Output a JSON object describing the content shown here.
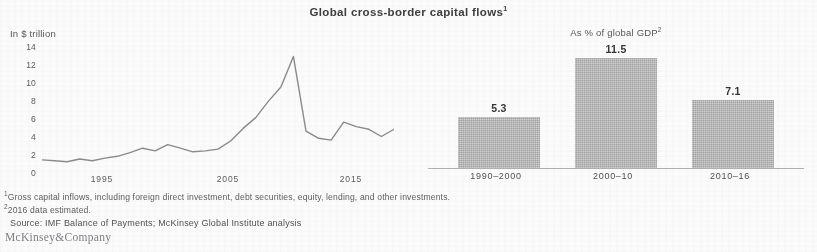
{
  "exhibit": {
    "title": "Global cross-border capital flows",
    "title_footnote_marker": "1",
    "brand": "McKinsey&Company"
  },
  "footnotes": {
    "note1_marker": "1",
    "note1": "Gross capital inflows, including foreign direct investment, debt securities, equity, lending, and other investments.",
    "note2_marker": "2",
    "note2": "2016 data estimated.",
    "source": "Source: IMF Balance of Payments; McKinsey Global Institute analysis"
  },
  "chart_data": [
    {
      "type": "line",
      "title": "Global cross-border capital flows",
      "ylabel": "In $ trillion",
      "xlabel": "",
      "ylim": [
        0,
        14
      ],
      "yticks": [
        14,
        12,
        10,
        8,
        6,
        4,
        2,
        0
      ],
      "xticks": [
        "1995",
        "2005",
        "2015"
      ],
      "grid": false,
      "x": [
        1990,
        1991,
        1992,
        1993,
        1994,
        1995,
        1996,
        1997,
        1998,
        1999,
        2000,
        2001,
        2002,
        2003,
        2004,
        2005,
        2006,
        2007,
        2008,
        2009,
        2010,
        2011,
        2012,
        2013,
        2014,
        2015,
        2016
      ],
      "values": [
        0.9,
        0.8,
        0.7,
        1.0,
        0.8,
        1.1,
        1.3,
        1.7,
        2.2,
        1.9,
        2.6,
        2.2,
        1.8,
        1.9,
        2.1,
        3.0,
        4.4,
        5.6,
        7.4,
        9.0,
        12.4,
        4.1,
        3.3,
        3.1,
        5.1,
        4.6,
        4.3,
        3.5,
        4.3
      ]
    },
    {
      "type": "bar",
      "title": "As % of global GDP",
      "title_footnote_marker": "2",
      "ylabel": "",
      "xlabel": "",
      "ylim": [
        0,
        13
      ],
      "grid": false,
      "categories": [
        "1990–2000",
        "2000–10",
        "2010–16"
      ],
      "values": [
        5.3,
        11.5,
        7.1
      ],
      "value_labels": [
        "5.3",
        "11.5",
        "7.1"
      ],
      "bar_color": "#b4b4b4"
    }
  ],
  "line_chart": {
    "unit_label": "In $ trillion",
    "y_ticks": [
      "14",
      "12",
      "10",
      "8",
      "6",
      "4",
      "2",
      "0"
    ],
    "x_ticks": [
      "1995",
      "2005",
      "2015"
    ]
  },
  "bar_chart": {
    "unit_label": "As % of global GDP",
    "bars": [
      {
        "category": "1990–2000",
        "label": "5.3"
      },
      {
        "category": "2000–10",
        "label": "11.5"
      },
      {
        "category": "2010–16",
        "label": "7.1"
      }
    ]
  }
}
